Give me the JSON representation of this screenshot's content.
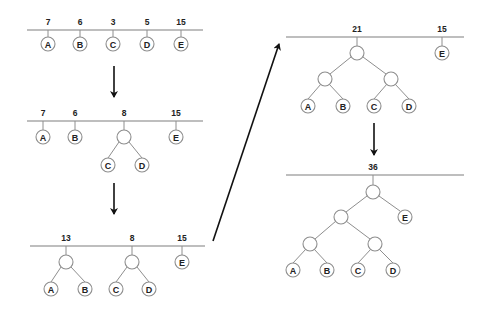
{
  "stages": [
    {
      "id": 1,
      "weights": [
        {
          "label": "7",
          "x": 48
        },
        {
          "label": "6",
          "x": 80
        },
        {
          "label": "3",
          "x": 113
        },
        {
          "label": "5",
          "x": 147
        },
        {
          "label": "15",
          "x": 181
        }
      ],
      "leaves": [
        "A",
        "B",
        "C",
        "D",
        "E"
      ]
    },
    {
      "id": 2,
      "weights": [
        {
          "label": "7"
        },
        {
          "label": "6"
        },
        {
          "label": "8"
        },
        {
          "label": "15"
        }
      ],
      "leaves": [
        "A",
        "B",
        "C",
        "D",
        "E"
      ]
    },
    {
      "id": 3,
      "weights": [
        {
          "label": "13"
        },
        {
          "label": "8"
        },
        {
          "label": "15"
        }
      ],
      "leaves": [
        "A",
        "B",
        "C",
        "D",
        "E"
      ]
    },
    {
      "id": 4,
      "weights": [
        {
          "label": "21"
        },
        {
          "label": "15"
        }
      ],
      "leaves": [
        "A",
        "B",
        "C",
        "D",
        "E"
      ]
    },
    {
      "id": 5,
      "weights": [
        {
          "label": "36"
        }
      ],
      "leaves": [
        "A",
        "B",
        "C",
        "D",
        "E"
      ]
    }
  ],
  "colors": {
    "baseline": "#a9a9a9",
    "edge": "#8e8e8e",
    "arrow": "#111111",
    "text": "#222222"
  }
}
